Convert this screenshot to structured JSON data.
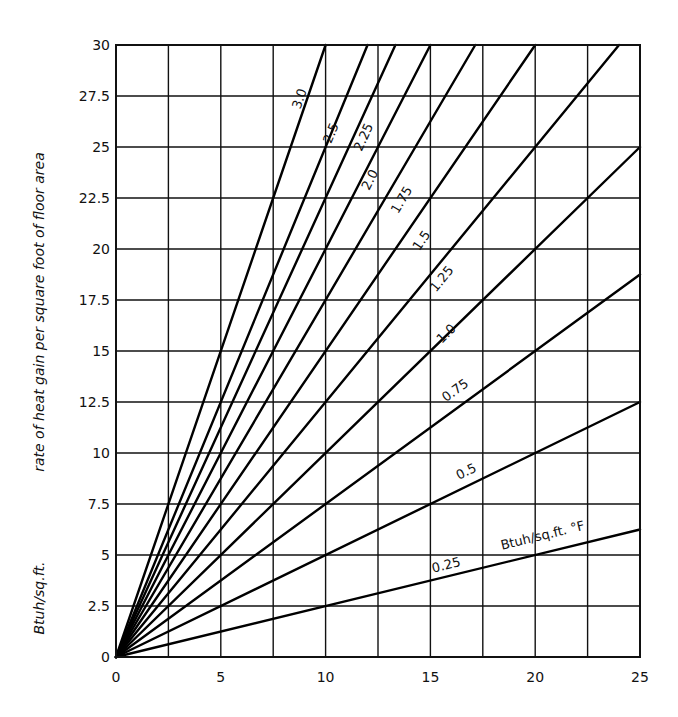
{
  "chart_data": {
    "type": "line",
    "title": "",
    "xlabel": "",
    "ylabel": "rate of heat gain per square foot of floor area",
    "ylabel_units": "Btuh/sq.ft.",
    "xlim": [
      0,
      25
    ],
    "ylim": [
      0,
      30
    ],
    "grid": true,
    "x_ticks": [
      0,
      5,
      10,
      15,
      20,
      25
    ],
    "x_tick_labels": [
      "0",
      "5",
      "10",
      "15",
      "20",
      "25"
    ],
    "x_gridlines": [
      0,
      2.5,
      5,
      7.5,
      10,
      12.5,
      15,
      17.5,
      20,
      22.5,
      25
    ],
    "y_ticks": [
      0,
      2.5,
      5,
      7.5,
      10,
      12.5,
      15,
      17.5,
      20,
      22.5,
      25,
      27.5,
      30
    ],
    "y_tick_labels": [
      "0",
      "2.5",
      "5",
      "7.5",
      "10",
      "12.5",
      "15",
      "17.5",
      "20",
      "22.5",
      "25",
      "27.5",
      "30"
    ],
    "legend": "none (lines labeled inline)",
    "series_units_label": "Btuh/sq.ft. °F",
    "series": [
      {
        "name": "3.0",
        "slope": 3.0,
        "x": [
          0,
          10
        ],
        "y": [
          0,
          30
        ],
        "label_pos": [
          8.95,
          27.3
        ]
      },
      {
        "name": "2.5",
        "slope": 2.5,
        "x": [
          0,
          12
        ],
        "y": [
          0,
          30
        ],
        "label_pos": [
          10.45,
          25.6
        ]
      },
      {
        "name": "2.25",
        "slope": 2.25,
        "x": [
          0,
          13.33
        ],
        "y": [
          0,
          30
        ],
        "label_pos": [
          12.0,
          25.4
        ]
      },
      {
        "name": "2.0",
        "slope": 2.0,
        "x": [
          0,
          15
        ],
        "y": [
          0,
          30
        ],
        "label_pos": [
          12.3,
          23.3
        ]
      },
      {
        "name": "1.75",
        "slope": 1.75,
        "x": [
          0,
          17.14
        ],
        "y": [
          0,
          30
        ],
        "label_pos": [
          13.8,
          22.3
        ]
      },
      {
        "name": "1.5",
        "slope": 1.5,
        "x": [
          0,
          20
        ],
        "y": [
          0,
          30
        ],
        "label_pos": [
          14.75,
          20.3
        ]
      },
      {
        "name": "1.25",
        "slope": 1.25,
        "x": [
          0,
          24
        ],
        "y": [
          0,
          30
        ],
        "label_pos": [
          15.7,
          18.4
        ]
      },
      {
        "name": "1.0",
        "slope": 1.0,
        "x": [
          0,
          25
        ],
        "y": [
          0,
          25
        ],
        "label_pos": [
          15.9,
          15.7
        ]
      },
      {
        "name": "0.75",
        "slope": 0.75,
        "x": [
          0,
          25
        ],
        "y": [
          0,
          18.75
        ],
        "label_pos": [
          16.3,
          12.9
        ]
      },
      {
        "name": "0.5",
        "slope": 0.5,
        "x": [
          0,
          25
        ],
        "y": [
          0,
          12.5
        ],
        "label_pos": [
          16.8,
          8.9
        ]
      },
      {
        "name": "0.25",
        "slope": 0.25,
        "x": [
          0,
          25
        ],
        "y": [
          0,
          6.25
        ],
        "label_pos": [
          15.8,
          4.3
        ]
      }
    ]
  },
  "labels": {
    "y_axis_title": "rate of heat gain per square foot of floor area",
    "y_axis_units": "Btuh/sq.ft.",
    "series_units": "Btuh/sq.ft. °F"
  }
}
